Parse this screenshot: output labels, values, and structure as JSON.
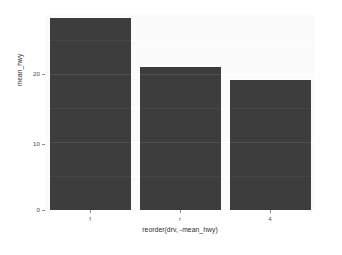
{
  "chart_data": {
    "type": "bar",
    "title": "",
    "subtitle": "",
    "xlabel": "reorder(drv, -mean_hwy)",
    "ylabel": "mean_hwy",
    "categories": [
      "f",
      "r",
      "4"
    ],
    "values": [
      28.2,
      21.0,
      19.2
    ],
    "series": [
      {
        "name": "mean_hwy",
        "values": [
          28.2,
          21.0,
          19.2
        ]
      }
    ],
    "ylim": [
      0,
      28.7
    ],
    "xlim": [
      0,
      3
    ],
    "y_ticks": [
      0,
      10,
      20
    ],
    "y_tick_labels": [
      "0",
      "10",
      "20"
    ],
    "x_tick_labels": [
      "f",
      "r",
      "4"
    ],
    "grid": true,
    "grid_major_y": [
      0,
      10,
      20
    ],
    "grid_minor_y": [
      5,
      15,
      25
    ],
    "legend": "none",
    "legend_position": "none",
    "annotations": [],
    "bar_color": "#3d3d3d",
    "panel_background": "#fbfbfb",
    "grid_color": "#ffffff",
    "plot_background": "#ffffff"
  },
  "axes": {
    "y": {
      "title": "mean_hwy",
      "ticks": [
        {
          "label": "20",
          "value": 20
        },
        {
          "label": "10",
          "value": 10
        },
        {
          "label": "0",
          "value": 0
        }
      ]
    },
    "x": {
      "title": "reorder(drv, -mean_hwy)",
      "ticks": [
        {
          "label": "f",
          "value": 0
        },
        {
          "label": "r",
          "value": 1
        },
        {
          "label": "4",
          "value": 2
        }
      ]
    }
  },
  "bars": [
    {
      "category": "f",
      "value": 28.2
    },
    {
      "category": "r",
      "value": 21.0
    },
    {
      "category": "4",
      "value": 19.2
    }
  ]
}
